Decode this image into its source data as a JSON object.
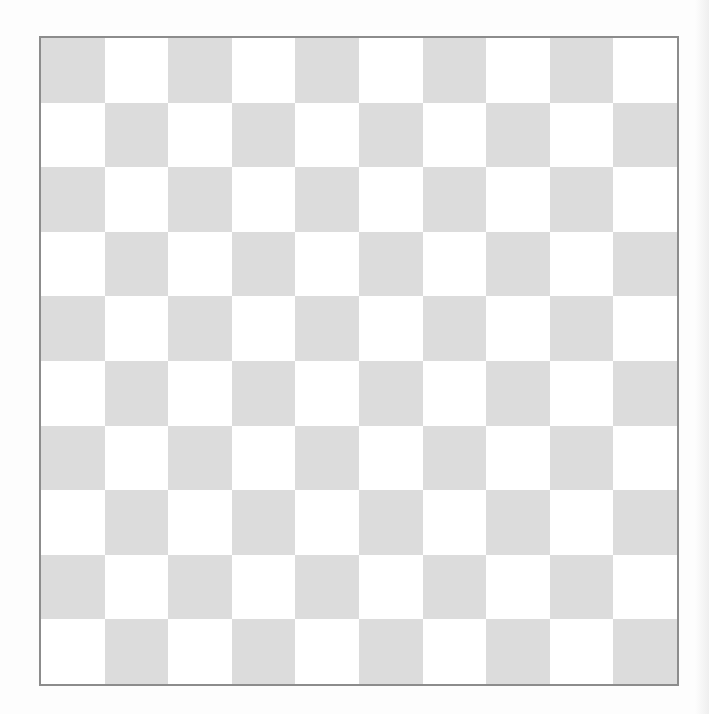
{
  "board": {
    "game": "Checkers / Draughts",
    "rows": 10,
    "cols": 10,
    "pieces": [],
    "first_square_color": "dark",
    "colors": {
      "dark_square": "#dcdcdc",
      "light_square": "#ffffff",
      "border": "#8c8c8c",
      "background": "#fdfdfd"
    },
    "label": "Empty 10x10 draughts board"
  }
}
